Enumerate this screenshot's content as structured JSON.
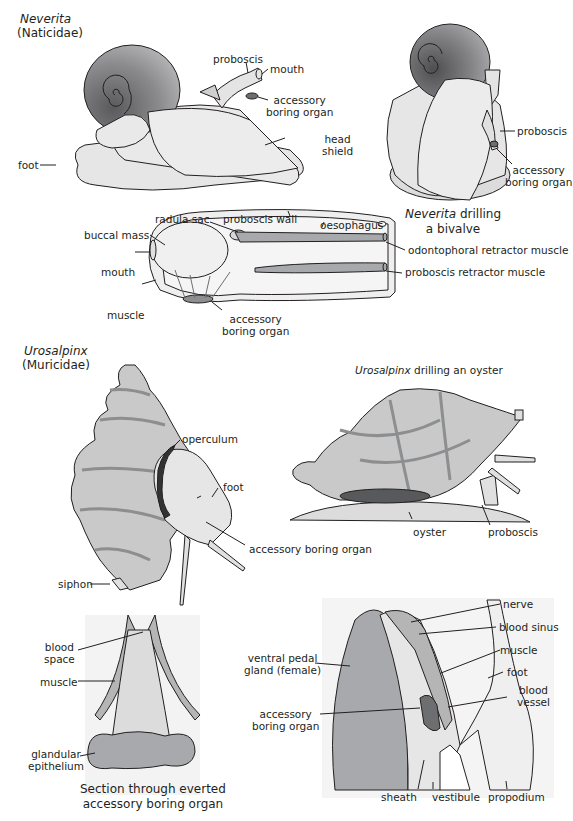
{
  "figure": {
    "panels": {
      "neverita": {
        "genus": "Neverita",
        "family": "(Naticidae)",
        "labels": {
          "proboscis": "proboscis",
          "mouth": "mouth",
          "accessory_1": "accessory",
          "accessory_2": "boring organ",
          "head_shield_1": "head",
          "head_shield_2": "shield",
          "foot": "foot"
        }
      },
      "neverita_drilling": {
        "caption_genus": "Neverita",
        "caption_rest": " drilling",
        "caption_line2": "a bivalve",
        "labels": {
          "proboscis": "proboscis",
          "accessory_1": "accessory",
          "accessory_2": "boring organ"
        }
      },
      "proboscis_section": {
        "labels": {
          "radula_sac": "radula sac",
          "proboscis_wall": "proboscis wall",
          "oesophagus": "oesophagus",
          "buccal_mass": "buccal mass",
          "mouth": "mouth",
          "muscle": "muscle",
          "odontophoral": "odontophoral retractor muscle",
          "proboscis_retractor": "proboscis retractor muscle",
          "accessory_1": "accessory",
          "accessory_2": "boring organ"
        }
      },
      "urosalpinx": {
        "genus": "Urosalpinx",
        "family": "(Muricidae)",
        "labels": {
          "operculum": "operculum",
          "foot": "foot",
          "accessory": "accessory boring organ",
          "siphon": "siphon"
        }
      },
      "urosalpinx_drilling": {
        "caption_genus": "Urosalpinx",
        "caption_rest": " drilling an oyster",
        "labels": {
          "oyster": "oyster",
          "proboscis": "proboscis"
        }
      },
      "abo_section": {
        "caption_line1": "Section through everted",
        "caption_line2": "accessory boring organ",
        "labels": {
          "blood_space_1": "blood",
          "blood_space_2": "space",
          "muscle": "muscle",
          "glandular_1": "glandular",
          "glandular_2": "epithelium"
        }
      },
      "foot_section": {
        "labels": {
          "nerve": "nerve",
          "blood_sinus": "blood sinus",
          "muscle": "muscle",
          "foot": "foot",
          "blood_vessel_1": "blood",
          "blood_vessel_2": "vessel",
          "ventral_pedal_1": "ventral pedal",
          "ventral_pedal_2": "gland (female)",
          "accessory_1": "accessory",
          "accessory_2": "boring organ",
          "sheath": "sheath",
          "vestibule": "vestibule",
          "propodium": "propodium"
        }
      }
    },
    "colors": {
      "outline": "#231f20",
      "body_fill": "#e8e8e8",
      "shell_dark": "#6d6e70",
      "shell_mid": "#9a9a9a",
      "shell_light": "#c8c8c8",
      "muscle_band": "#a7a9ac",
      "dark_organ": "#58595b",
      "operculum": "#333333"
    }
  }
}
